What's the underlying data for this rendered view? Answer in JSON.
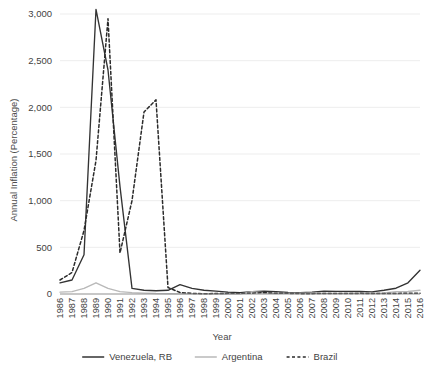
{
  "chart_data": {
    "type": "line",
    "title": "",
    "xlabel": "Year",
    "ylabel": "Annual Inflation (Percentage)",
    "ylim": [
      0,
      3000
    ],
    "yticks": [
      0,
      500,
      1000,
      1500,
      2000,
      2500,
      3000
    ],
    "ytick_labels": [
      "0",
      "500",
      "1,000",
      "1,500",
      "2,000",
      "2,500",
      "3,000"
    ],
    "grid": true,
    "legend_position": "bottom",
    "categories": [
      "1986",
      "1987",
      "1988",
      "1989",
      "1990",
      "1991",
      "1992",
      "1993",
      "1994",
      "1995",
      "1996",
      "1997",
      "1998",
      "1999",
      "2000",
      "2001",
      "2002",
      "2003",
      "2004",
      "2005",
      "2006",
      "2007",
      "2008",
      "2009",
      "2010",
      "2011",
      "2012",
      "2013",
      "2014",
      "2015",
      "2016"
    ],
    "series": [
      {
        "name": "Venezuela, RB",
        "color": "#333333",
        "style": "solid",
        "values": [
          120,
          150,
          420,
          3050,
          2400,
          1150,
          60,
          40,
          35,
          40,
          100,
          60,
          40,
          30,
          20,
          15,
          25,
          30,
          25,
          18,
          15,
          20,
          30,
          28,
          28,
          27,
          22,
          40,
          62,
          120,
          255
        ]
      },
      {
        "name": "Argentina",
        "color": "#b9b9b9",
        "style": "solid",
        "values": [
          20,
          25,
          60,
          120,
          60,
          25,
          15,
          10,
          5,
          3,
          2,
          1,
          1,
          0,
          0,
          0,
          25,
          13,
          4,
          9,
          10,
          8,
          8,
          6,
          10,
          9,
          10,
          11,
          24,
          27,
          40
        ]
      },
      {
        "name": "Brazil",
        "color": "#2b2b2b",
        "style": "dashed",
        "values": [
          150,
          230,
          680,
          1430,
          2950,
          440,
          1000,
          1950,
          2080,
          70,
          16,
          7,
          3,
          5,
          7,
          7,
          8,
          15,
          7,
          7,
          4,
          4,
          6,
          5,
          5,
          7,
          5,
          6,
          6,
          9,
          9
        ]
      }
    ]
  },
  "legend": {
    "items": [
      {
        "label": "Venezuela, RB"
      },
      {
        "label": "Argentina"
      },
      {
        "label": "Brazil"
      }
    ]
  }
}
